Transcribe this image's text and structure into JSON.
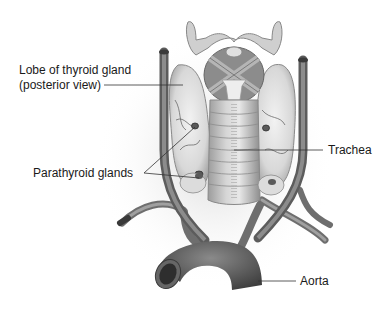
{
  "diagram": {
    "labels": {
      "thyroid_lobe_line1": "Lobe of thyroid gland",
      "thyroid_lobe_line2": "(posterior view)",
      "parathyroid": "Parathyroid glands",
      "trachea": "Trachea",
      "aorta": "Aorta"
    },
    "structures": [
      "thyroid-lobe-left",
      "thyroid-lobe-right",
      "larynx",
      "trachea",
      "parathyroid-glands",
      "carotid-arteries",
      "aortic-arch",
      "subclavian-arteries"
    ],
    "colors": {
      "tissue_light": "#e6e6e6",
      "tissue_mid": "#bdbdbd",
      "vessel": "#7a7a7a",
      "vessel_dark": "#4a4a4a",
      "leader_line": "#333333",
      "text": "#1a1a1a"
    }
  }
}
